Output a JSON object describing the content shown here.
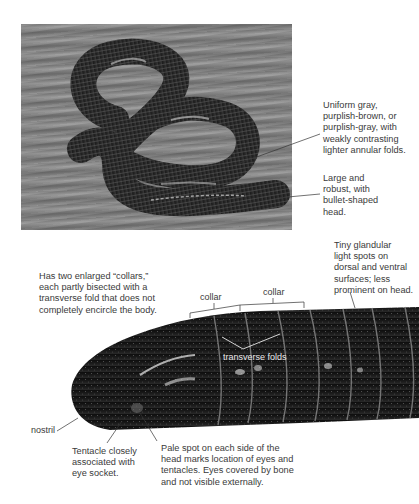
{
  "figure": {
    "top_photo": {
      "alt": "Coiled dark gray caecilian on wooden surface",
      "annotations": [
        {
          "id": "coloration",
          "text": "Uniform gray,\npurplish-brown, or\npurplish-gray, with\nweakly contrasting\nlighter annular folds."
        },
        {
          "id": "head-shape",
          "text": "Large and\nrobust, with\nbullet-shaped\nhead."
        }
      ]
    },
    "closeup_photo": {
      "alt": "Close-up of caecilian head and anterior body",
      "annotations": [
        {
          "id": "collars",
          "text": "Has two enlarged “collars,”\neach partly bisected with a\ntransverse fold that does not\ncompletely encircle the body."
        },
        {
          "id": "glandular-spots",
          "text": "Tiny glandular\nlight spots on\ndorsal and ventral\nsurfaces; less\nprominent on head."
        },
        {
          "id": "tentacle",
          "text": "Tentacle closely\nassociated  with\neye socket."
        },
        {
          "id": "pale-spot",
          "text": "Pale spot on each side of the\nhead marks location of eyes and\ntentacles. Eyes covered by bone\nand not visible externally."
        }
      ],
      "labels": {
        "collar_1": "collar",
        "collar_2": "collar",
        "transverse_folds": "transverse folds",
        "nostril": "nostril"
      }
    },
    "colors": {
      "text": "#3a3a3a",
      "leader_line": "#333333",
      "background": "#ffffff"
    }
  }
}
